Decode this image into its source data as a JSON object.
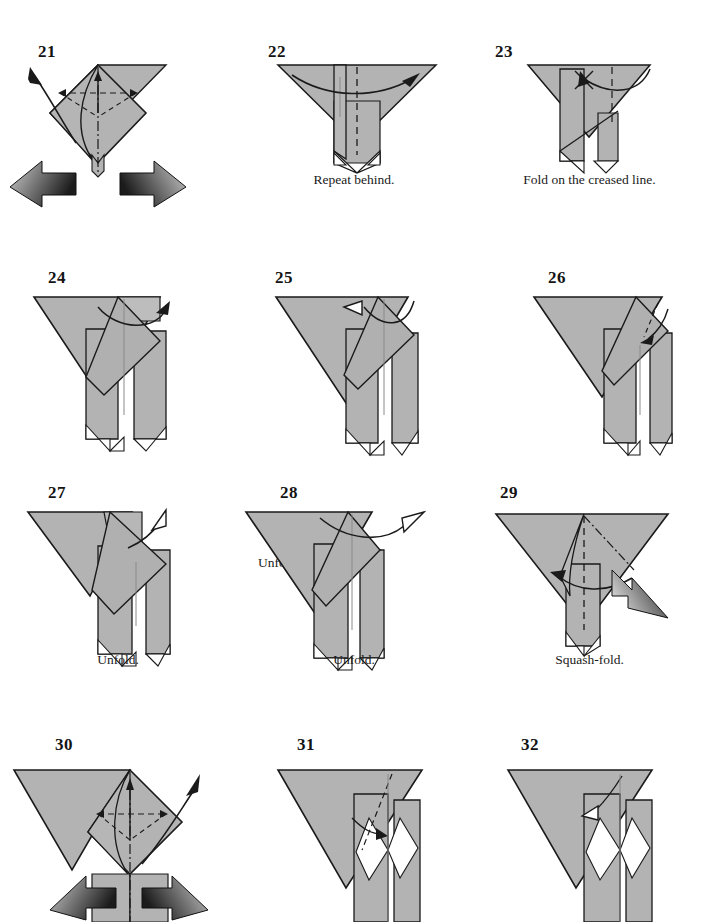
{
  "page": {
    "background_color": "#ffffff",
    "paper_front_color": "#b3b3b3",
    "paper_back_color": "#ffffff",
    "line_color": "#1a1a1a",
    "arrow_fill_color": "#111111",
    "width": 707,
    "height": 918
  },
  "steps": [
    {
      "number": "21",
      "caption": "",
      "num_x": 38,
      "num_y": 42,
      "icon": "diamond-with-two-push-arrows"
    },
    {
      "number": "22",
      "caption": "Repeat behind.",
      "num_x": 268,
      "num_y": 42,
      "caption_y": 172,
      "icon": "wide-triangle-with-fold-arrow"
    },
    {
      "number": "23",
      "caption": "Fold on the creased line.",
      "num_x": 494,
      "num_y": 42,
      "caption_y": 172,
      "icon": "wide-triangle-with-crease-arrow"
    },
    {
      "number": "24",
      "caption": "",
      "num_x": 48,
      "num_y": 268,
      "icon": "tilted-triangle-with-loop-arrow"
    },
    {
      "number": "25",
      "caption": "Unfold.",
      "num_x": 275,
      "num_y": 268,
      "caption_x": 272,
      "caption_y": 370,
      "icon": "tilted-triangle-with-unfold-arrow"
    },
    {
      "number": "26",
      "caption": "",
      "num_x": 556,
      "num_y": 268,
      "icon": "tilted-triangle-with-down-arrow"
    },
    {
      "number": "27",
      "caption": "Unfold.",
      "num_x": 48,
      "num_y": 503,
      "caption_y": 672,
      "icon": "tilted-triangle-with-out-arrow"
    },
    {
      "number": "28",
      "caption": "Unfold.",
      "num_x": 280,
      "num_y": 503,
      "caption_y": 672,
      "icon": "tilted-triangle-with-long-unfold-arrow"
    },
    {
      "number": "29",
      "caption": "Squash-fold.",
      "num_x": 504,
      "num_y": 503,
      "caption_y": 672,
      "icon": "wide-triangle-with-squash-arrow"
    },
    {
      "number": "30",
      "caption": "",
      "num_x": 55,
      "num_y": 755,
      "icon": "diamond-with-two-push-arrows-tilted"
    },
    {
      "number": "31",
      "caption": "",
      "num_x": 297,
      "num_y": 755,
      "icon": "tilted-triangle-with-small-fold-arrow"
    },
    {
      "number": "32",
      "caption": "",
      "num_x": 529,
      "num_y": 755,
      "icon": "tilted-triangle-with-hollow-arrow"
    }
  ]
}
